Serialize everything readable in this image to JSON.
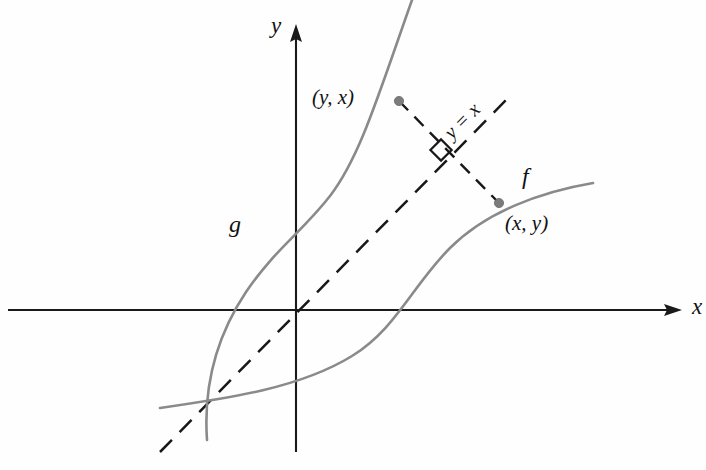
{
  "figure": {
    "background_color": "#fefefe",
    "curve_color": "#8a8a8a",
    "axis_color": "#1a1a1a",
    "dash_color": "#181818",
    "point_color": "#7c7c7c"
  },
  "axes": {
    "origin": {
      "x": 296,
      "y": 310
    },
    "x_axis": {
      "label": "x",
      "label_pos": {
        "x": 692,
        "y": 314
      },
      "start": {
        "x": 8,
        "y": 310
      },
      "arrow_tip": {
        "x": 682,
        "y": 310
      }
    },
    "y_axis": {
      "label": "y",
      "label_pos": {
        "x": 271,
        "y": 33
      },
      "start": {
        "x": 296,
        "y": 452
      },
      "arrow_tip": {
        "x": 296,
        "y": 24
      }
    }
  },
  "curves": [
    {
      "name": "f",
      "label": "f",
      "label_pos": {
        "x": 522,
        "y": 184
      },
      "path": "M 160,408 C 230,398 300,388 352,356 C 396,329 412,286 450,248 C 486,212 540,192 593,183",
      "x_intercept": {
        "x": 405,
        "y": 310
      }
    },
    {
      "name": "g",
      "label": "g",
      "label_pos": {
        "x": 229,
        "y": 232
      },
      "path": "M 207,440 C 203,382 218,334 246,292 C 276,248 302,232 330,196 C 360,157 378,96 412,0",
      "x_intercept": {
        "x": 229,
        "y": 310
      },
      "y_intercept": {
        "x": 296,
        "y": 200
      }
    }
  ],
  "identity_line": {
    "label": "y = x",
    "label_pos": {
      "x": 452,
      "y": 140
    },
    "label_rotation_deg": -45,
    "start": {
      "x": 160,
      "y": 452
    },
    "end": {
      "x": 512,
      "y": 94
    }
  },
  "connector": {
    "description": "dashed segment joining the point (x, y) on f to its mirror image (y, x) on g",
    "start": {
      "x": 399,
      "y": 101
    },
    "end": {
      "x": 499,
      "y": 203
    }
  },
  "right_angle": {
    "description": "square marker showing the connector is perpendicular to the line y = x",
    "center": {
      "x": 441,
      "y": 150
    },
    "size": 15,
    "rotation_deg": 45
  },
  "points": [
    {
      "label": "(y, x)",
      "marker": {
        "x": 399,
        "y": 101
      },
      "label_pos": {
        "x": 333,
        "y": 104
      },
      "on_curve": "g"
    },
    {
      "label": "(x, y)",
      "marker": {
        "x": 499,
        "y": 203
      },
      "label_pos": {
        "x": 505,
        "y": 230
      },
      "on_curve": "f"
    }
  ]
}
